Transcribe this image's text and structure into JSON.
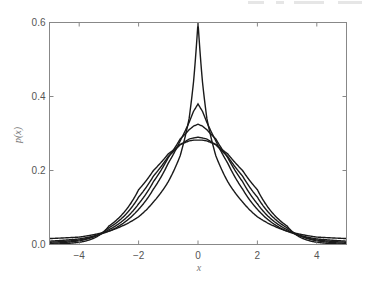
{
  "chart_data": {
    "type": "line",
    "title": "",
    "xlabel": "x",
    "ylabel": "p(x)",
    "xlim": [
      -5,
      5
    ],
    "ylim": [
      0,
      0.6
    ],
    "xticks": [
      -4,
      -2,
      0,
      2,
      4
    ],
    "xtick_labels": [
      "−4",
      "−2",
      "0",
      "2",
      "4"
    ],
    "yticks": [
      0.0,
      0.2,
      0.4,
      0.6
    ],
    "ytick_labels": [
      "0.0",
      "0.2",
      "0.4",
      "0.6"
    ],
    "grid": false,
    "legend": null,
    "line_color": "#1a1a1a",
    "x": [
      0,
      0.15,
      0.3,
      0.6,
      1,
      1.5,
      2,
      3,
      4,
      5
    ],
    "symmetric_about_zero": true,
    "series": [
      {
        "name": "curve-1",
        "values": [
          0.6,
          0.44,
          0.34,
          0.24,
          0.17,
          0.115,
          0.075,
          0.036,
          0.02,
          0.016
        ]
      },
      {
        "name": "curve-2",
        "values": [
          0.38,
          0.36,
          0.33,
          0.28,
          0.22,
          0.15,
          0.095,
          0.036,
          0.015,
          0.009
        ]
      },
      {
        "name": "curve-3",
        "values": [
          0.325,
          0.32,
          0.31,
          0.285,
          0.235,
          0.17,
          0.11,
          0.04,
          0.012,
          0.006
        ]
      },
      {
        "name": "curve-4",
        "values": [
          0.29,
          0.288,
          0.285,
          0.27,
          0.238,
          0.185,
          0.128,
          0.045,
          0.01,
          0.003
        ]
      },
      {
        "name": "curve-5",
        "values": [
          0.282,
          0.282,
          0.28,
          0.27,
          0.245,
          0.2,
          0.148,
          0.05,
          0.006,
          0.001
        ]
      }
    ]
  }
}
